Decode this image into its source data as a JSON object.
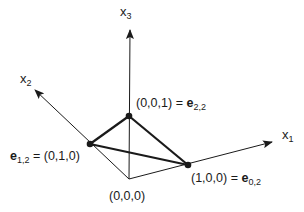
{
  "diagram": {
    "type": "simplex-3d",
    "axes": [
      {
        "name": "x1",
        "base": "x",
        "sub": "1"
      },
      {
        "name": "x2",
        "base": "x",
        "sub": "2"
      },
      {
        "name": "x3",
        "base": "x",
        "sub": "3"
      }
    ],
    "points": {
      "origin": {
        "label": "(0,0,0)"
      },
      "p001": {
        "coords": "(0,0,1)",
        "eq": "=",
        "vec": "e",
        "vec_sub": "2,2"
      },
      "p010": {
        "coords": "(0,1,0)",
        "eq": "=",
        "vec": "e",
        "vec_sub": "1,2"
      },
      "p100": {
        "coords": "(1,0,0)",
        "eq": "=",
        "vec": "e",
        "vec_sub": "0,2"
      }
    },
    "colors": {
      "line": "#1a1a1a",
      "background": "#ffffff"
    }
  }
}
